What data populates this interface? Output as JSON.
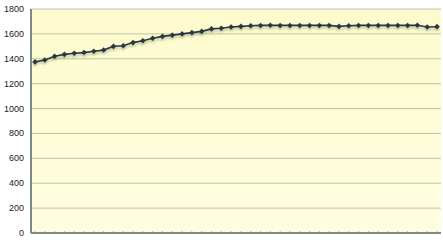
{
  "chart_data": {
    "type": "line",
    "title": "",
    "xlabel": "",
    "ylabel": "",
    "ylim": [
      0,
      1800
    ],
    "yticks": [
      0,
      200,
      400,
      600,
      800,
      1000,
      1200,
      1400,
      1600,
      1800
    ],
    "grid": true,
    "legend": "none",
    "x_tick_labels_visible": false,
    "point_count_note": "Exact point count not resolvable; 42 assumed from ~9.7px spacing.",
    "values_note": "First ~3 values read from pixel positions; remaining values interpolated along the visible curve.",
    "series": [
      {
        "name": "Series 1",
        "color": "#2b3545",
        "marker": "diamond",
        "values": [
          1375,
          1390,
          1420,
          1435,
          1445,
          1450,
          1460,
          1470,
          1500,
          1505,
          1530,
          1545,
          1565,
          1580,
          1590,
          1600,
          1610,
          1620,
          1640,
          1645,
          1655,
          1660,
          1665,
          1668,
          1670,
          1668,
          1668,
          1668,
          1668,
          1668,
          1668,
          1660,
          1665,
          1668,
          1668,
          1668,
          1668,
          1668,
          1668,
          1670,
          1655,
          1658
        ]
      }
    ]
  },
  "colors": {
    "plot_bg": "#fefcd2",
    "grid": "#bcc4ad",
    "axis": "#7d8a86"
  }
}
